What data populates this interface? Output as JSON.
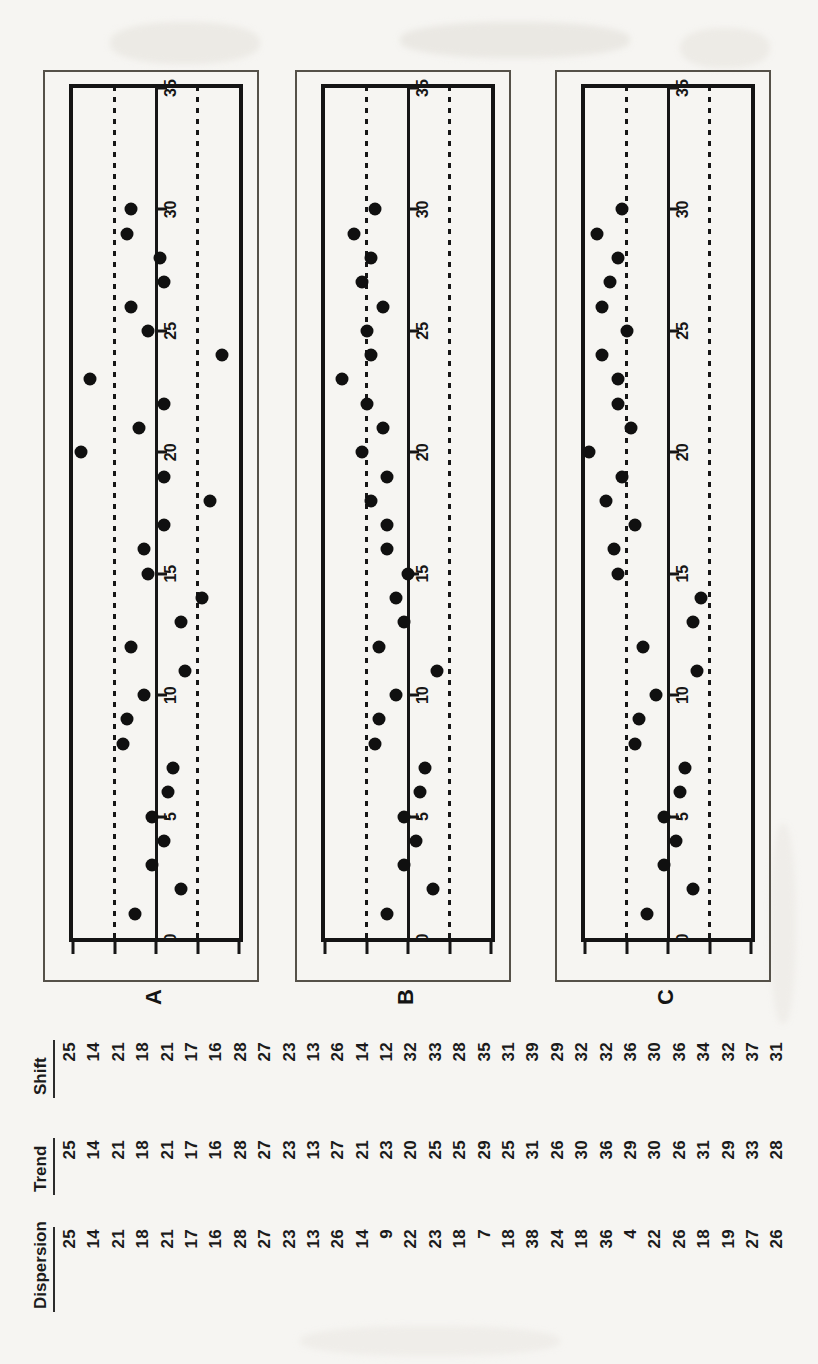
{
  "colors": {
    "paper": "#f6f5f2",
    "ink": "#161616",
    "outer_box_border": "#555149"
  },
  "table": {
    "headers": [
      "Dispersion",
      "Trend",
      "Shift"
    ],
    "columns": {
      "dispersion": [
        25,
        14,
        21,
        18,
        21,
        17,
        16,
        28,
        27,
        23,
        13,
        26,
        14,
        9,
        22,
        23,
        18,
        7,
        18,
        38,
        24,
        18,
        36,
        4,
        22,
        26,
        18,
        19,
        27,
        26
      ],
      "trend": [
        25,
        14,
        21,
        18,
        21,
        17,
        16,
        28,
        27,
        23,
        13,
        27,
        21,
        23,
        20,
        25,
        25,
        29,
        25,
        31,
        26,
        30,
        36,
        29,
        30,
        26,
        31,
        29,
        33,
        28
      ],
      "shift": [
        25,
        14,
        21,
        18,
        21,
        17,
        16,
        28,
        27,
        23,
        13,
        26,
        14,
        12,
        32,
        33,
        28,
        35,
        31,
        39,
        29,
        32,
        32,
        36,
        30,
        36,
        34,
        32,
        37,
        31
      ]
    }
  },
  "chart_data": [
    {
      "type": "scatter",
      "label": "A",
      "series_name": "Dispersion",
      "x": [
        1,
        2,
        3,
        4,
        5,
        6,
        7,
        8,
        9,
        10,
        11,
        12,
        13,
        14,
        15,
        16,
        17,
        18,
        19,
        20,
        21,
        22,
        23,
        24,
        25,
        26,
        27,
        28,
        29,
        30
      ],
      "values": [
        25,
        14,
        21,
        18,
        21,
        17,
        16,
        28,
        27,
        23,
        13,
        26,
        14,
        9,
        22,
        23,
        18,
        7,
        18,
        38,
        24,
        18,
        36,
        4,
        22,
        26,
        18,
        19,
        27,
        26
      ],
      "xlim": [
        0,
        35
      ],
      "ylim": [
        0,
        40
      ],
      "xticks": [
        0,
        5,
        10,
        15,
        20,
        25,
        30,
        35
      ],
      "yticks": [
        0,
        10,
        20,
        30,
        40
      ],
      "centerline": 20,
      "upper_dashed_limit": 30,
      "lower_dashed_limit": 10,
      "grid": false,
      "legend": "none"
    },
    {
      "type": "scatter",
      "label": "B",
      "series_name": "Trend",
      "x": [
        1,
        2,
        3,
        4,
        5,
        6,
        7,
        8,
        9,
        10,
        11,
        12,
        13,
        14,
        15,
        16,
        17,
        18,
        19,
        20,
        21,
        22,
        23,
        24,
        25,
        26,
        27,
        28,
        29,
        30
      ],
      "values": [
        25,
        14,
        21,
        18,
        21,
        17,
        16,
        28,
        27,
        23,
        13,
        27,
        21,
        23,
        20,
        25,
        25,
        29,
        25,
        31,
        26,
        30,
        36,
        29,
        30,
        26,
        31,
        29,
        33,
        28
      ],
      "xlim": [
        0,
        35
      ],
      "ylim": [
        0,
        40
      ],
      "xticks": [
        0,
        5,
        10,
        15,
        20,
        25,
        30,
        35
      ],
      "yticks": [
        0,
        10,
        20,
        30,
        40
      ],
      "centerline": 20,
      "upper_dashed_limit": 30,
      "lower_dashed_limit": 10,
      "grid": false,
      "legend": "none"
    },
    {
      "type": "scatter",
      "label": "C",
      "series_name": "Shift",
      "x": [
        1,
        2,
        3,
        4,
        5,
        6,
        7,
        8,
        9,
        10,
        11,
        12,
        13,
        14,
        15,
        16,
        17,
        18,
        19,
        20,
        21,
        22,
        23,
        24,
        25,
        26,
        27,
        28,
        29,
        30
      ],
      "values": [
        25,
        14,
        21,
        18,
        21,
        17,
        16,
        28,
        27,
        23,
        13,
        26,
        14,
        12,
        32,
        33,
        28,
        35,
        31,
        39,
        29,
        32,
        32,
        36,
        30,
        36,
        34,
        32,
        37,
        31
      ],
      "xlim": [
        0,
        35
      ],
      "ylim": [
        0,
        40
      ],
      "xticks": [
        0,
        5,
        10,
        15,
        20,
        25,
        30,
        35
      ],
      "yticks": [
        0,
        10,
        20,
        30,
        40
      ],
      "centerline": 20,
      "upper_dashed_limit": 30,
      "lower_dashed_limit": 10,
      "grid": false,
      "legend": "none"
    }
  ]
}
